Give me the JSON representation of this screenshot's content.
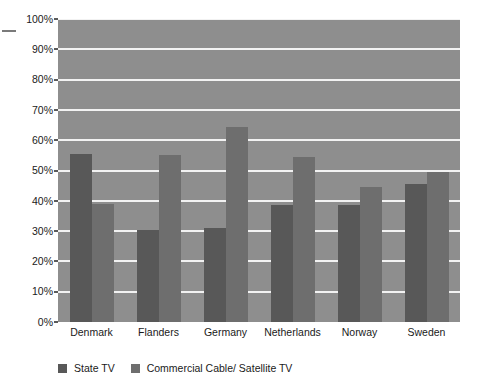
{
  "chart_data": {
    "type": "bar",
    "title": "",
    "subtitle": "",
    "xlabel": "",
    "ylabel": "",
    "categories": [
      "Denmark",
      "Flanders",
      "Germany",
      "Netherlands",
      "Norway",
      "Sweden"
    ],
    "series": [
      {
        "name": "State TV",
        "color": "#585858",
        "values": [
          55.5,
          30.5,
          31.0,
          38.5,
          38.5,
          45.5
        ]
      },
      {
        "name": "Commercial Cable/ Satellite TV",
        "color": "#6e6e6e",
        "values": [
          39.0,
          55.0,
          64.5,
          54.5,
          44.5,
          49.5
        ]
      }
    ],
    "ylim": [
      0,
      100
    ],
    "y_ticks": [
      0,
      10,
      20,
      30,
      40,
      50,
      60,
      70,
      80,
      90,
      100
    ],
    "y_tick_labels": [
      "0%",
      "10%",
      "20%",
      "30%",
      "40%",
      "50%",
      "60%",
      "70%",
      "80%",
      "90%",
      "100%"
    ],
    "grid": true,
    "grid_axis": "y",
    "grid_color": "#f2f2f2",
    "plot_background": "#8e8e8e",
    "legend_position": "bottom-left"
  },
  "legend": {
    "items": [
      {
        "label": "State TV",
        "color": "#585858"
      },
      {
        "label": "Commercial Cable/ Satellite TV",
        "color": "#6e6e6e"
      }
    ]
  }
}
